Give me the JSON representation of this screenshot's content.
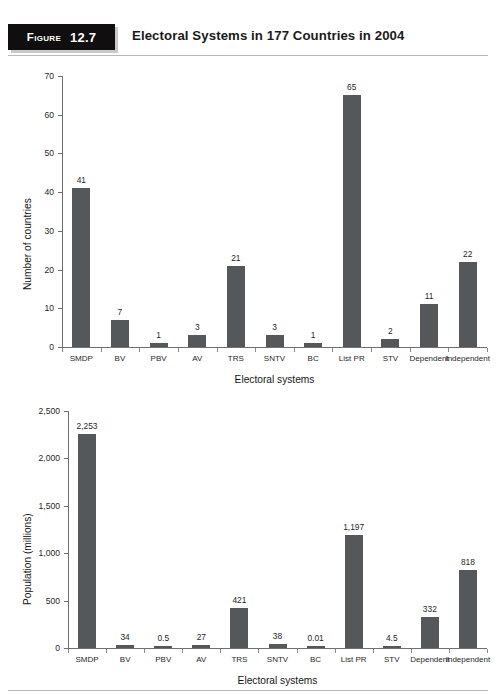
{
  "figure": {
    "badge_word": "Figure",
    "badge_number": "12.7",
    "title": "Electoral Systems in 177 Countries in 2004"
  },
  "colors": {
    "bar": "#55585a",
    "badge_background": "#100e0e",
    "badge_text": "#ffffff",
    "axis": "#6f6f6f",
    "rule": "#b9b9b9"
  },
  "chart_data": [
    {
      "type": "bar",
      "title": "",
      "xlabel": "Electoral systems",
      "ylabel": "Number of countries",
      "categories": [
        "SMDP",
        "BV",
        "PBV",
        "AV",
        "TRS",
        "SNTV",
        "BC",
        "List PR",
        "STV",
        "Dependent",
        "Independent"
      ],
      "values": [
        41,
        7,
        1,
        3,
        21,
        3,
        1,
        65,
        2,
        11,
        22
      ],
      "value_labels": [
        "41",
        "7",
        "1",
        "3",
        "21",
        "3",
        "1",
        "65",
        "2",
        "11",
        "22"
      ],
      "ylim": [
        0,
        70
      ],
      "yticks": [
        0,
        10,
        20,
        30,
        40,
        50,
        60,
        70
      ],
      "ytick_labels": [
        "0",
        "10",
        "20",
        "30",
        "40",
        "50",
        "60",
        "70"
      ],
      "grid": false,
      "legend": false
    },
    {
      "type": "bar",
      "title": "",
      "xlabel": "Electoral systems",
      "ylabel": "Population (millions)",
      "categories": [
        "SMDP",
        "BV",
        "PBV",
        "AV",
        "TRS",
        "SNTV",
        "BC",
        "List PR",
        "STV",
        "Dependent",
        "Independent"
      ],
      "values": [
        2253,
        34,
        0.5,
        27,
        421,
        38,
        0.01,
        1197,
        4.5,
        332,
        818
      ],
      "value_labels": [
        "2,253",
        "34",
        "0.5",
        "27",
        "421",
        "38",
        "0.01",
        "1,197",
        "4.5",
        "332",
        "818"
      ],
      "ylim": [
        0,
        2500
      ],
      "yticks": [
        0,
        500,
        1000,
        1500,
        2000,
        2500
      ],
      "ytick_labels": [
        "0",
        "500",
        "1,000",
        "1,500",
        "2,000",
        "2,500"
      ],
      "grid": false,
      "legend": false
    }
  ]
}
